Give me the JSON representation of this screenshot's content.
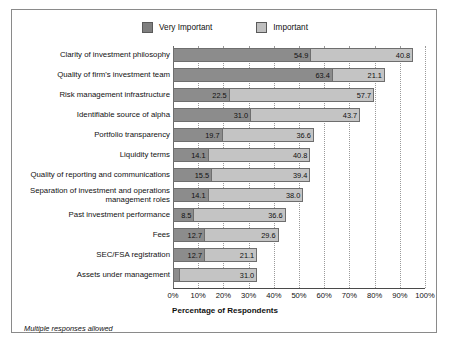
{
  "chart_data": {
    "type": "bar",
    "orientation": "horizontal",
    "stacked": true,
    "title": "",
    "xlabel": "Percentage of Respondents",
    "ylabel": "",
    "xlim": [
      0,
      100
    ],
    "xtick_labels": [
      "0%",
      "10%",
      "20%",
      "30%",
      "40%",
      "50%",
      "60%",
      "70%",
      "80%",
      "90%",
      "100%"
    ],
    "xtick_values": [
      0,
      10,
      20,
      30,
      40,
      50,
      60,
      70,
      80,
      90,
      100
    ],
    "grid": "vertical-dotted",
    "legend_position": "top-center",
    "footnote": "Multiple responses allowed",
    "categories": [
      "Clarity of investment philosophy",
      "Quality of firm's investment team",
      "Risk management infrastructure",
      "Identifiable source of alpha",
      "Portfolio transparency",
      "Liquidity terms",
      "Quality of reporting and communications",
      "Separation of investment and operations management roles",
      "Past investment performance",
      "Fees",
      "SEC/FSA registration",
      "Assets under management"
    ],
    "series": [
      {
        "name": "Very Important",
        "color": "#8c8c8c",
        "values": [
          54.9,
          63.4,
          22.5,
          31.0,
          19.7,
          14.1,
          15.5,
          14.1,
          8.5,
          12.7,
          12.7,
          2.8
        ]
      },
      {
        "name": "Important",
        "color": "#c4c4c4",
        "values": [
          40.8,
          21.1,
          57.7,
          43.7,
          36.6,
          40.8,
          39.4,
          38.0,
          36.6,
          29.6,
          21.1,
          31.0
        ]
      }
    ],
    "data_labels": [
      {
        "category": "Clarity of investment philosophy",
        "very_important": "54.9",
        "important": "40.8"
      },
      {
        "category": "Quality of firm's investment team",
        "very_important": "63.4",
        "important": "21.1"
      },
      {
        "category": "Risk management infrastructure",
        "very_important": "22.5",
        "important": "57.7"
      },
      {
        "category": "Identifiable source of alpha",
        "very_important": "31.0",
        "important": "43.7"
      },
      {
        "category": "Portfolio transparency",
        "very_important": "19.7",
        "important": "36.6"
      },
      {
        "category": "Liquidity terms",
        "very_important": "14.1",
        "important": "40.8"
      },
      {
        "category": "Quality of reporting and communications",
        "very_important": "15.5",
        "important": "39.4"
      },
      {
        "category": "Separation of investment and operations management roles",
        "very_important": "14.1",
        "important": "38.0"
      },
      {
        "category": "Past investment performance",
        "very_important": "8.5",
        "important": "36.6"
      },
      {
        "category": "Fees",
        "very_important": "12.7",
        "important": "29.6"
      },
      {
        "category": "SEC/FSA registration",
        "very_important": "12.7",
        "important": "21.1"
      },
      {
        "category": "Assets under management",
        "very_important": "",
        "important": "31.0"
      }
    ]
  },
  "legend": {
    "items": [
      {
        "label": "Very Important",
        "swatch": "dark"
      },
      {
        "label": "Important",
        "swatch": "light"
      }
    ]
  },
  "axis": {
    "title": "Percentage of Respondents"
  },
  "footnote": {
    "text": "Multiple responses allowed"
  }
}
